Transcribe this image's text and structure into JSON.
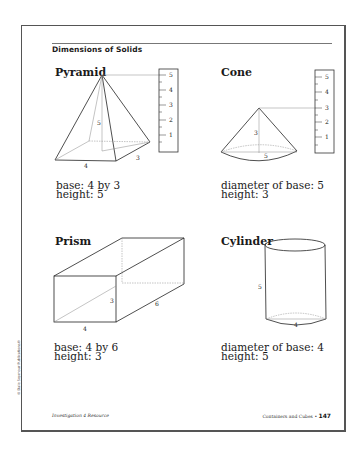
{
  "page": {
    "title": "Dimensions of Solids",
    "footer_left": "Investigation 4 Resource",
    "footer_right": "Containers and Cubes",
    "footer_bullet": "•",
    "page_number": "147",
    "copyright": "© Dale Seymour Publications®"
  },
  "solids": [
    {
      "name": "Pyramid",
      "line1": "base: 4 by 3",
      "line2": "height: 5",
      "labels": {
        "height": "5",
        "width": "4",
        "depth": "3"
      },
      "ruler": [
        "5",
        "4",
        "3",
        "2",
        "1"
      ]
    },
    {
      "name": "Cone",
      "line1": "diameter of base: 5",
      "line2": "height: 3",
      "labels": {
        "height": "3",
        "diameter": "5"
      },
      "ruler": [
        "5",
        "4",
        "3",
        "2",
        "1"
      ]
    },
    {
      "name": "Prism",
      "line1": "base: 4 by 6",
      "line2": "height: 3",
      "labels": {
        "height": "3",
        "width": "4",
        "depth": "6"
      }
    },
    {
      "name": "Cylinder",
      "line1": "diameter of base: 4",
      "line2": "height: 5",
      "labels": {
        "height": "5",
        "diameter": "4"
      }
    }
  ]
}
